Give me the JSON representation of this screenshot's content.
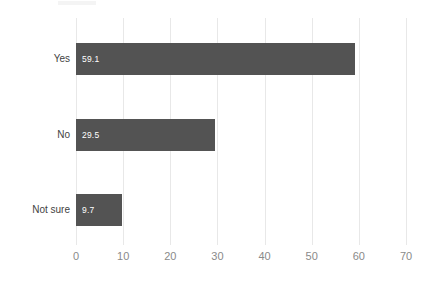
{
  "chart_data": {
    "type": "bar",
    "orientation": "horizontal",
    "title": "",
    "xlabel": "",
    "ylabel": "",
    "categories": [
      "Yes",
      "No",
      "Not sure"
    ],
    "values": [
      59.1,
      29.5,
      9.7
    ],
    "value_labels": [
      "59.1",
      "29.5",
      "9.7"
    ],
    "xlim": [
      0,
      70
    ],
    "xticks": [
      0,
      10,
      20,
      30,
      40,
      50,
      60,
      70
    ],
    "xtick_labels": [
      "0",
      "10",
      "20",
      "30",
      "40",
      "50",
      "60",
      "70"
    ],
    "grid": "vertical",
    "legend": null,
    "bar_color": "#535353",
    "value_label_color": "#ffffff",
    "gridline_color": "#e8e8e8",
    "axis_label_color": "#8a8a8a",
    "category_label_color": "#3f3f3f",
    "background_color": "#ffffff"
  }
}
